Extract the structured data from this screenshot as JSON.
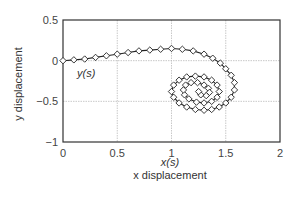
{
  "chart_data": {
    "type": "line",
    "title": "",
    "xlabel": "x displacement",
    "ylabel": "y displacement",
    "xlim": [
      0,
      2
    ],
    "ylim": [
      -1,
      0.5
    ],
    "xticks": [
      "0",
      "0.5",
      "1",
      "1.5",
      "2"
    ],
    "yticks": [
      "0.5",
      "0",
      "-0.5",
      "-1"
    ],
    "grid": true,
    "marker": "diamond",
    "annotations": [
      {
        "text": "y(s)",
        "x": 0.1,
        "y": -0.12
      },
      {
        "text": "x(s)",
        "x": 1.5,
        "y": -1.17
      }
    ],
    "series": [
      {
        "name": "spiral trajectory",
        "description": "Parametric curve starting at origin, rising to ~0.15 near x=1, sweeping to x~1.6, then spiraling inward toward center ~(1.25, -0.38)",
        "x": [
          0.0,
          0.1,
          0.2,
          0.3,
          0.4,
          0.5,
          0.6,
          0.7,
          0.8,
          0.9,
          1.0,
          1.1,
          1.2,
          1.3,
          1.38,
          1.45,
          1.5,
          1.55,
          1.58,
          1.58,
          1.55,
          1.5,
          1.44,
          1.37,
          1.3,
          1.22,
          1.14,
          1.07,
          1.02,
          1.0,
          1.02,
          1.07,
          1.14,
          1.22,
          1.3,
          1.37,
          1.42,
          1.44,
          1.42,
          1.37,
          1.3,
          1.23,
          1.16,
          1.12,
          1.11,
          1.13,
          1.18,
          1.24,
          1.3,
          1.34,
          1.35,
          1.32,
          1.27,
          1.25
        ],
        "y": [
          0.0,
          0.01,
          0.02,
          0.04,
          0.06,
          0.08,
          0.1,
          0.12,
          0.13,
          0.14,
          0.15,
          0.14,
          0.12,
          0.08,
          0.03,
          -0.03,
          -0.1,
          -0.18,
          -0.27,
          -0.36,
          -0.45,
          -0.52,
          -0.57,
          -0.6,
          -0.61,
          -0.6,
          -0.57,
          -0.52,
          -0.45,
          -0.38,
          -0.3,
          -0.24,
          -0.2,
          -0.19,
          -0.2,
          -0.24,
          -0.3,
          -0.38,
          -0.45,
          -0.5,
          -0.52,
          -0.51,
          -0.47,
          -0.42,
          -0.36,
          -0.3,
          -0.27,
          -0.27,
          -0.3,
          -0.34,
          -0.39,
          -0.43,
          -0.42,
          -0.38
        ]
      }
    ]
  },
  "labels": {
    "xlabel": "x displacement",
    "ylabel": "y displacement",
    "x_annot": "x(s)",
    "y_annot": "y(s)"
  }
}
